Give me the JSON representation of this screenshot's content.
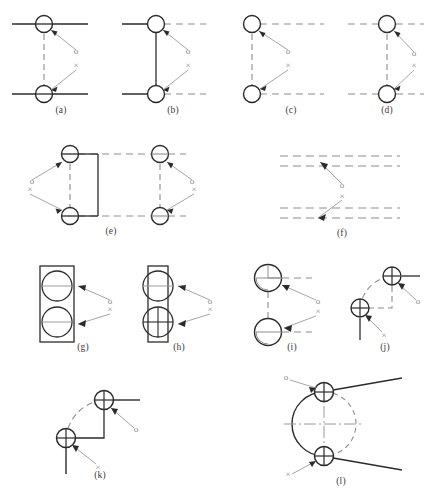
{
  "figure": {
    "width": 430,
    "height": 504,
    "colors": {
      "solid_line": "#2b2b2b",
      "dashed_line": "#8d8d8d",
      "circle_stroke": "#2b2b2b",
      "leader_line": "#9a9a9a",
      "marker_text": "#8a8a8a",
      "caption_text": "#3a3a3a",
      "background": "#ffffff"
    },
    "markers": {
      "positive_label": "o",
      "negative_label": "×"
    },
    "captions": [
      "(a)",
      "(b)",
      "(c)",
      "(d)",
      "(e)",
      "(f)",
      "(g)",
      "(h)",
      "(i)",
      "(j)",
      "(k)",
      "(l)"
    ]
  },
  "panels": [
    {
      "id": "a",
      "caption": "(a)",
      "description": "Two solid horizontal edges joined by a dashed vertical link with circles at both junctions",
      "left": 6,
      "top": 8,
      "width": 104,
      "height": 100,
      "caption_top": 105,
      "marker_o": "o",
      "marker_x": "×"
    },
    {
      "id": "b",
      "caption": "(b)",
      "description": "Solid horizontal edges on the left, dashed on the right, joined by a solid vertical link",
      "left": 118,
      "top": 8,
      "width": 104,
      "height": 100,
      "caption_top": 105,
      "marker_o": "o",
      "marker_x": "×"
    },
    {
      "id": "c",
      "caption": "(c)",
      "description": "Dashed horizontal edges extending right, joined by a dashed vertical link",
      "left": 236,
      "top": 8,
      "width": 104,
      "height": 100,
      "caption_top": 105,
      "marker_o": "o",
      "marker_x": "×"
    },
    {
      "id": "d",
      "caption": "(d)",
      "description": "Dashed horizontal edges on both sides joined by a dashed vertical link",
      "left": 348,
      "top": 8,
      "width": 80,
      "height": 100,
      "caption_top": 105,
      "marker_o": "o",
      "marker_x": "×"
    },
    {
      "id": "e",
      "caption": "(e)",
      "description": "Wide rectangular loop with four circle junctions, solid inner right edge on the left group",
      "left": 18,
      "top": 140,
      "width": 180,
      "height": 90,
      "caption_top": 228,
      "marker_o": "o",
      "marker_x": "×"
    },
    {
      "id": "f",
      "caption": "(f)",
      "description": "Two pairs of dashed horizontal lines with leader arrows into the gaps, no circles",
      "left": 276,
      "top": 146,
      "width": 130,
      "height": 82,
      "caption_top": 228,
      "marker_o": "o",
      "marker_x": "×"
    },
    {
      "id": "g",
      "caption": "(g)",
      "description": "Tall solid rectangle containing two circles fully inside its width, each with a horizontal centerline",
      "left": 36,
      "top": 262,
      "width": 100,
      "height": 82,
      "caption_top": 341,
      "marker_o": "o",
      "marker_x": "×"
    },
    {
      "id": "h",
      "caption": "(h)",
      "description": "Narrow solid rectangle with two circles protruding past both sides, lower circle has a vertical centerline",
      "left": 132,
      "top": 262,
      "width": 100,
      "height": 82,
      "caption_top": 341,
      "marker_o": "o",
      "marker_x": "×"
    },
    {
      "id": "i",
      "caption": "(i)",
      "description": "Two large circles with interior quarter arcs, dashed horizontal stubs to the right and a dashed vertical link",
      "left": 246,
      "top": 262,
      "width": 96,
      "height": 82,
      "caption_top": 341,
      "marker_o": "o",
      "marker_x": "×"
    },
    {
      "id": "j",
      "caption": "(j)",
      "description": "Diagonally offset circles joined by a dashed arc and a dashed right-angle corner",
      "left": 344,
      "top": 262,
      "width": 84,
      "height": 86,
      "caption_top": 341,
      "marker_o": "o",
      "marker_x": "×"
    },
    {
      "id": "k",
      "caption": "(k)",
      "description": "Diagonally offset circles joined by a dashed arc and a solid right-angle corner with solid stubs",
      "left": 48,
      "top": 382,
      "width": 104,
      "height": 96,
      "caption_top": 479,
      "marker_o": "o",
      "marker_x": "×"
    },
    {
      "id": "l",
      "caption": "(l)",
      "description": "Large circle with solid left arc and dashed right arc, two small circles on the circumference with solid tangent rays and dash-dot centerlines",
      "left": 272,
      "top": 378,
      "width": 140,
      "height": 100,
      "caption_top": 479,
      "marker_o": "o",
      "marker_x": "×"
    }
  ]
}
